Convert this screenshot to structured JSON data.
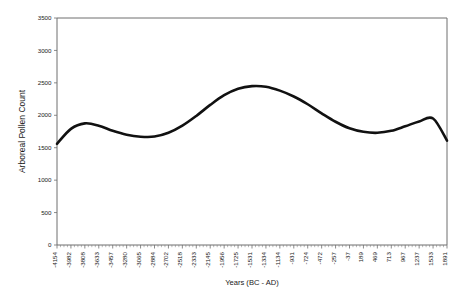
{
  "chart_data": {
    "type": "line",
    "title": "",
    "xlabel": "Years (BC - AD)",
    "ylabel": "Arboreal Pollen Count",
    "ylim": [
      0,
      3500
    ],
    "ytick_values": [
      0,
      500,
      1000,
      1500,
      2000,
      2500,
      3000,
      3500
    ],
    "ytick_labels": [
      "0",
      "500",
      "1000",
      "1500",
      "2000",
      "2500",
      "3000",
      "3500"
    ],
    "grid": false,
    "legend": "none",
    "x_categories": [
      "-4154",
      "-3982",
      "-3808",
      "-3633",
      "-3457",
      "-3280",
      "-3065",
      "-2884",
      "-2702",
      "-2518",
      "-2333",
      "-2145",
      "-1956",
      "-1725",
      "-1531",
      "-1334",
      "-1134",
      "-931",
      "-724",
      "-472",
      "-257",
      "-37",
      "189",
      "469",
      "713",
      "967",
      "1237",
      "1533",
      "1891"
    ],
    "series": [
      {
        "name": "Arboreal Pollen Count",
        "color": "#111111",
        "values": [
          1560,
          1790,
          1875,
          1840,
          1760,
          1700,
          1670,
          1672,
          1730,
          1840,
          1990,
          2160,
          2310,
          2410,
          2450,
          2440,
          2380,
          2290,
          2170,
          2030,
          1900,
          1800,
          1745,
          1730,
          1760,
          1830,
          1905,
          1950,
          1610
        ]
      }
    ],
    "axis_line_color": "#6e6e6e",
    "minor_ticks_per_label": 4
  },
  "figure": {
    "background": "#ffffff",
    "plot_left": 57,
    "plot_top": 18,
    "plot_right": 447,
    "plot_bottom": 245
  }
}
